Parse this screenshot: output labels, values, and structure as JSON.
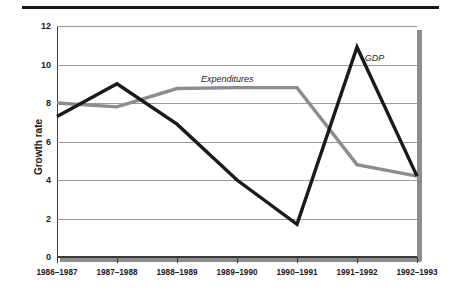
{
  "chart_data": {
    "type": "line",
    "title": "",
    "xlabel": "",
    "ylabel": "Growth rate",
    "categories": [
      "1986–1987",
      "1987–1988",
      "1988–1989",
      "1989–1990",
      "1990–1991",
      "1991–1992",
      "1992–1993"
    ],
    "ylim": [
      0,
      12
    ],
    "yticks": [
      0,
      2,
      4,
      6,
      8,
      10,
      12
    ],
    "grid": true,
    "legend_position": "inline-annotations",
    "series": [
      {
        "name": "GDP",
        "color": "#1a1a1a",
        "values": [
          7.3,
          9.0,
          6.9,
          4.0,
          1.7,
          10.9,
          4.2
        ]
      },
      {
        "name": "Expenditures",
        "color": "#8b8d8f",
        "values": [
          8.0,
          7.8,
          8.75,
          8.8,
          8.8,
          4.8,
          4.2
        ]
      }
    ],
    "annotations": [
      {
        "text": "Expenditures",
        "x_frac": 0.4,
        "y_value": 9.45,
        "style": "italic"
      },
      {
        "text": "GDP",
        "x_frac": 0.855,
        "y_value": 10.55,
        "style": "italic"
      }
    ]
  },
  "axes": {
    "y_tick_labels": [
      "12",
      "10",
      "8",
      "6",
      "4",
      "2",
      "0"
    ],
    "y_title": "Growth rate",
    "x_tick_labels": [
      "1986–1987",
      "1987–1988",
      "1988–1989",
      "1989–1990",
      "1990–1991",
      "1991–1992",
      "1992–1993"
    ]
  },
  "colors": {
    "gdp_line": "#1a1a1a",
    "expenditures_line": "#8b8d8f",
    "gridline": "#9a9a9a",
    "axis": "#3a3a3a",
    "top_rule": "#14161a",
    "shadow": "#8b8d8f",
    "background": "#ffffff"
  }
}
